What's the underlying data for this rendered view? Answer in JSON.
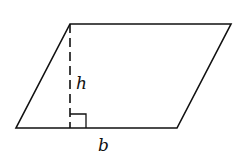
{
  "diagram": {
    "type": "parallelogram",
    "labels": {
      "height": "h",
      "base": "b"
    },
    "vertices": {
      "top_left": [
        70,
        24
      ],
      "top_right": [
        231,
        24
      ],
      "bottom_right": [
        177,
        128
      ],
      "bottom_left": [
        16,
        128
      ]
    },
    "height_line": {
      "x": 70,
      "y1": 24,
      "y2": 128,
      "style": "dashed"
    },
    "right_angle_marker": {
      "x": 70,
      "y": 114,
      "size": 16
    },
    "stroke_color": "#111111"
  }
}
